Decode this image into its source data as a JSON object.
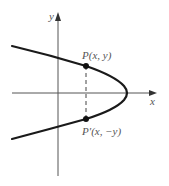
{
  "figure": {
    "axes": {
      "x_label": "x",
      "y_label": "y"
    },
    "curve": {
      "description": "parabola opening left, symmetric about x-axis",
      "color": "#1a1a1a"
    },
    "points": [
      {
        "id": "P",
        "label": "P(x, y)"
      },
      {
        "id": "P-prime",
        "label": "P′(x, −y)"
      }
    ],
    "dashed_segment": "vertical dashed line joining P and P′",
    "colors": {
      "axis": "#444444",
      "curve": "#1a1a1a",
      "label": "#555555"
    }
  }
}
